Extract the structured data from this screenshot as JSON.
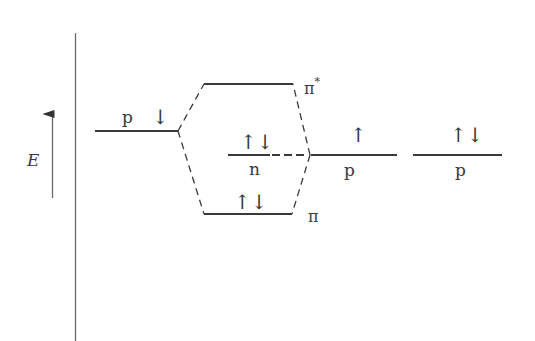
{
  "diagram": {
    "type": "molecular-orbital-energy-diagram",
    "axis": {
      "label": "E",
      "direction": "up"
    },
    "levels": {
      "left_p": {
        "label": "p",
        "electrons": "↓"
      },
      "pi_star": {
        "label": "π",
        "superscript": "*",
        "electrons": ""
      },
      "n": {
        "label": "n",
        "electrons": "↑↓"
      },
      "pi": {
        "label": "π",
        "electrons": "↑↓"
      },
      "right_p": {
        "label": "p",
        "electrons": "↑"
      },
      "far_right_p": {
        "label": "p",
        "electrons": "↑↓"
      }
    },
    "colors": {
      "line": "#3a3a3a",
      "axis": "#6a6a6a",
      "background": "#ffffff"
    }
  }
}
